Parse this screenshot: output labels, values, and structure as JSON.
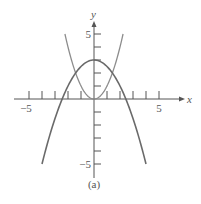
{
  "chart_data": {
    "type": "line",
    "title": "",
    "caption": "(a)",
    "xlabel": "x",
    "ylabel": "y",
    "xlim": [
      -6,
      6.8
    ],
    "ylim": [
      -6,
      6
    ],
    "grid": false,
    "x_tick_values": [
      -5,
      -4,
      -3,
      -2,
      -1,
      1,
      2,
      3,
      4,
      5
    ],
    "x_tick_labels": [
      {
        "value": -5,
        "label": "−5"
      },
      {
        "value": 5,
        "label": "5"
      }
    ],
    "y_tick_values": [
      -5,
      -4,
      -3,
      -2,
      -1,
      1,
      2,
      3,
      4,
      5
    ],
    "y_tick_labels": [
      {
        "value": 5,
        "label": "5"
      },
      {
        "value": -5,
        "label": "−5"
      }
    ],
    "series": [
      {
        "name": "y = x^2",
        "expression": "x^2",
        "domain": [
          -2.236,
          2.236
        ],
        "color": "#8c8c8c",
        "x": [
          -2.236,
          -2,
          -1.5,
          -1,
          -0.5,
          0,
          0.5,
          1,
          1.5,
          2,
          2.236
        ],
        "y": [
          5,
          4,
          2.25,
          1,
          0.25,
          0,
          0.25,
          1,
          2.25,
          4,
          5
        ]
      },
      {
        "name": "y = 3 - x^2/2",
        "expression": "3 - x^2/2",
        "domain": [
          -4,
          4
        ],
        "color": "#6a6a6a",
        "x": [
          -4,
          -3,
          -2.449,
          -2,
          -1,
          0,
          1,
          2,
          2.449,
          3,
          4
        ],
        "y": [
          -5,
          -1.5,
          0,
          1,
          2.5,
          3,
          2.5,
          1,
          0,
          -1.5,
          -5
        ]
      }
    ],
    "intersections": [
      {
        "x": -1.414,
        "y": 2
      },
      {
        "x": 1.414,
        "y": 2
      }
    ]
  },
  "colors": {
    "axis": "#555555",
    "background": "#ffffff"
  }
}
